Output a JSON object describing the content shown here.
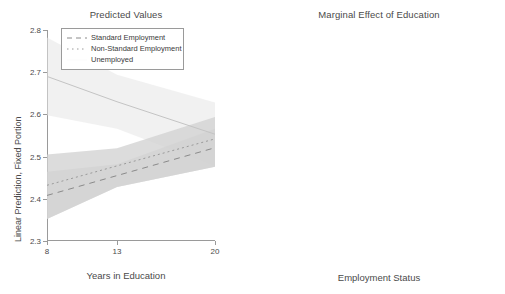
{
  "figure": {
    "panels": [
      "Predicted Values",
      "Marginal Effect of Education"
    ]
  },
  "left": {
    "title": "Predicted Values",
    "xlabel": "Years in Education",
    "ylabel": "Linear Prediction, Fixed Portion",
    "yticks": [
      "2.8",
      "2.7",
      "2.6",
      "2.5",
      "2.4",
      "2.3"
    ],
    "xticks": [
      "8",
      "13",
      "20"
    ],
    "legend": [
      {
        "label": "Standard Employment",
        "key": "dashed-line-key"
      },
      {
        "label": "Non-Standard Employment",
        "key": "dotted-line-key"
      },
      {
        "label": "Unemployed",
        "key": "blank-line-key"
      }
    ]
  },
  "right": {
    "title": "Marginal Effect of Education",
    "xlabel": "Employment Status",
    "ylabel": "Effects on Linear Prediction, Fixed Portion",
    "yticks": [
      ".02",
      "0",
      "-.02",
      "-.04"
    ],
    "xticks": [
      "Standard Employment",
      "Non-Standard Employment",
      "Unemployed"
    ]
  },
  "chart_data": [
    {
      "type": "line",
      "title": "Predicted Values",
      "xlabel": "Years in Education",
      "ylabel": "Linear Prediction, Fixed Portion",
      "xlim": [
        8,
        20
      ],
      "ylim": [
        2.3,
        2.8
      ],
      "yticks": [
        2.3,
        2.4,
        2.5,
        2.6,
        2.7,
        2.8
      ],
      "xticks": [
        8,
        13,
        20
      ],
      "grid": false,
      "legend_position": "upper-center",
      "shaded_confidence_bands": true,
      "x": [
        8,
        13,
        20
      ],
      "series": [
        {
          "name": "Standard Employment",
          "style": "dashed",
          "values": [
            2.408,
            2.455,
            2.521
          ],
          "ci_lower": [
            2.352,
            2.428,
            2.476
          ],
          "ci_upper": [
            2.464,
            2.482,
            2.566
          ]
        },
        {
          "name": "Non-Standard Employment",
          "style": "dotted",
          "values": [
            2.432,
            2.478,
            2.542
          ],
          "ci_lower": [
            2.352,
            2.428,
            2.476
          ],
          "ci_upper": [
            2.505,
            2.52,
            2.594
          ]
        },
        {
          "name": "Unemployed",
          "style": "solid",
          "values": [
            2.69,
            2.63,
            2.553
          ],
          "ci_lower": [
            2.598,
            2.566,
            2.478
          ],
          "ci_upper": [
            2.782,
            2.694,
            2.628
          ]
        }
      ]
    },
    {
      "type": "scatter",
      "title": "Marginal Effect of Education",
      "xlabel": "Employment Status",
      "ylabel": "Effects on Linear Prediction, Fixed Portion",
      "ylim": [
        -0.04,
        0.02
      ],
      "yticks": [
        -0.04,
        -0.02,
        0,
        0.02
      ],
      "ytick_labels": [
        "-.04",
        "-.02",
        "0",
        ".02"
      ],
      "categories": [
        "Standard Employment",
        "Non-Standard Employment",
        "Unemployed"
      ],
      "values": [
        0.01,
        0.0135,
        -0.013
      ],
      "ci_lower": [
        0.0005,
        0.004,
        -0.0305
      ],
      "ci_upper": [
        0.0205,
        0.021,
        -0.0025
      ],
      "reference_line": 0,
      "reference_line_style": "dotted",
      "grid": false,
      "marker": "diamond-hollow"
    }
  ]
}
